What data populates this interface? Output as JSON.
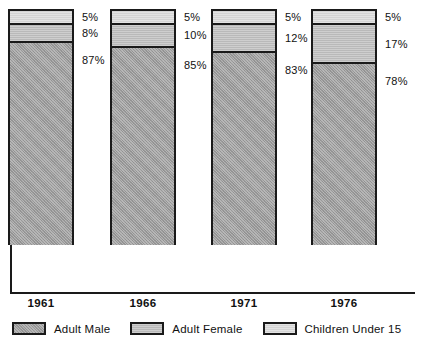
{
  "chart_data": {
    "type": "bar",
    "subtype": "stacked-bar-100-percent",
    "title": "",
    "xlabel": "",
    "ylabel": "",
    "ylim": [
      0,
      100
    ],
    "grid": false,
    "legend_position": "bottom",
    "categories": [
      "1961",
      "1966",
      "1971",
      "1976"
    ],
    "series": [
      {
        "name": "Adult Male",
        "values": [
          87,
          85,
          83,
          78
        ],
        "color": "#9a9a9a"
      },
      {
        "name": "Adult Female",
        "values": [
          8,
          10,
          12,
          17
        ],
        "color": "#b9b9b9"
      },
      {
        "name": "Children Under 15",
        "values": [
          5,
          5,
          5,
          5
        ],
        "color": "#d4d4d4"
      }
    ],
    "data_labels": [
      {
        "category": "1961",
        "children": "5%",
        "female": "8%",
        "male": "87%"
      },
      {
        "category": "1966",
        "children": "5%",
        "female": "10%",
        "male": "85%"
      },
      {
        "category": "1971",
        "children": "5%",
        "female": "12%",
        "male": "83%"
      },
      {
        "category": "1976",
        "children": "5%",
        "female": "17%",
        "male": "78%"
      }
    ]
  },
  "bars": [
    {
      "year": "1961",
      "left": 8,
      "children": {
        "label": "5%",
        "pct": 5
      },
      "female": {
        "label": "8%",
        "pct": 8
      },
      "male": {
        "label": "87%",
        "pct": 87
      }
    },
    {
      "year": "1966",
      "left": 110,
      "children": {
        "label": "5%",
        "pct": 5
      },
      "female": {
        "label": "10%",
        "pct": 10
      },
      "male": {
        "label": "85%",
        "pct": 85
      }
    },
    {
      "year": "1971",
      "left": 211,
      "children": {
        "label": "5%",
        "pct": 5
      },
      "female": {
        "label": "12%",
        "pct": 12
      },
      "male": {
        "label": "83%",
        "pct": 83
      }
    },
    {
      "year": "1976",
      "left": 311,
      "children": {
        "label": "5%",
        "pct": 5
      },
      "female": {
        "label": "17%",
        "pct": 17
      },
      "male": {
        "label": "78%",
        "pct": 78
      }
    }
  ],
  "legend": {
    "items": [
      {
        "label": "Adult Male",
        "color": "#9a9a9a",
        "swatch_name": "legend-swatch-adult-male"
      },
      {
        "label": "Adult Female",
        "color": "#b9b9b9",
        "swatch_name": "legend-swatch-adult-female"
      },
      {
        "label": "Children Under 15",
        "color": "#d4d4d4",
        "swatch_name": "legend-swatch-children-under-15"
      }
    ]
  },
  "axis": {
    "line_color": "#1a1a1a"
  }
}
